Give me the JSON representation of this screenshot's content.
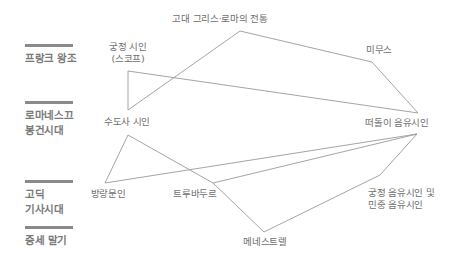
{
  "periods": [
    {
      "id": "frankish",
      "lines": [
        "프랑크 왕조"
      ],
      "top": 44
    },
    {
      "id": "romanesque",
      "lines": [
        "로마네스끄",
        "봉건시대"
      ],
      "top": 101
    },
    {
      "id": "gothic",
      "lines": [
        "고딕",
        "기사시대"
      ],
      "top": 180
    },
    {
      "id": "late-medieval",
      "lines": [
        "중세 말기"
      ],
      "top": 226
    }
  ],
  "nodes": {
    "greco_roman": {
      "lines": [
        "고대 그리스·로마의 전통"
      ],
      "x": 220,
      "y": 13
    },
    "court_poet": {
      "lines": [
        "궁정 시인",
        "(스코프)"
      ],
      "x": 128,
      "y": 41
    },
    "mime": {
      "lines": [
        "미무스"
      ],
      "x": 379,
      "y": 44
    },
    "monk_poet": {
      "lines": [
        "수도사 시인"
      ],
      "x": 127,
      "y": 116
    },
    "wandering_minstrel": {
      "lines": [
        "떠돌이 음유시인"
      ],
      "x": 397,
      "y": 117
    },
    "vagrant_scholar": {
      "lines": [
        "방랑문인"
      ],
      "x": 108,
      "y": 188
    },
    "troubadour": {
      "lines": [
        "트루바두르"
      ],
      "x": 195,
      "y": 188
    },
    "court_folk_minstrel": {
      "lines": [
        "궁정 음유시인 및",
        "민중 음유시인"
      ],
      "x": 368,
      "y": 187,
      "align": "left"
    },
    "menestrel": {
      "lines": [
        "메네스트렐"
      ],
      "x": 265,
      "y": 236
    }
  },
  "edges": [
    {
      "from": "court_poet",
      "to": "monk_poet",
      "points": [
        [
          128,
          71
        ],
        [
          128,
          110
        ]
      ]
    },
    {
      "from": "monk_poet",
      "to": "greco_roman",
      "points": [
        [
          128,
          110
        ],
        [
          240,
          31
        ]
      ]
    },
    {
      "from": "greco_roman",
      "to": "mime",
      "points": [
        [
          240,
          31
        ],
        [
          372,
          62
        ]
      ]
    },
    {
      "from": "mime",
      "to": "wandering_minstrel",
      "points": [
        [
          372,
          62
        ],
        [
          418,
          113
        ]
      ]
    },
    {
      "from": "court_poet",
      "to": "wandering_minstrel",
      "points": [
        [
          128,
          71
        ],
        [
          418,
          113
        ]
      ]
    },
    {
      "from": "monk_poet",
      "to": "vagrant_scholar",
      "points": [
        [
          128,
          135
        ],
        [
          105,
          183
        ]
      ]
    },
    {
      "from": "monk_poet",
      "to": "troubadour",
      "points": [
        [
          128,
          135
        ],
        [
          213,
          183
        ]
      ]
    },
    {
      "from": "troubadour",
      "to": "menestrel",
      "points": [
        [
          213,
          183
        ],
        [
          264,
          232
        ]
      ]
    },
    {
      "from": "menestrel",
      "to": "court_folk_minstrel",
      "points": [
        [
          264,
          232
        ],
        [
          380,
          175
        ]
      ]
    },
    {
      "from": "court_folk_minstrel",
      "to": "wandering_minstrel",
      "points": [
        [
          380,
          175
        ],
        [
          417,
          134
        ]
      ]
    },
    {
      "from": "vagrant_scholar",
      "to": "wandering_minstrel",
      "points": [
        [
          105,
          183
        ],
        [
          417,
          134
        ]
      ]
    },
    {
      "from": "troubadour",
      "to": "wandering_minstrel",
      "points": [
        [
          213,
          183
        ],
        [
          417,
          134
        ]
      ]
    }
  ],
  "colors": {
    "edge": "#9a9a9a",
    "period_bar": "#8a8a8a",
    "period_text": "#7a7a7a",
    "node_text": "#6e6e6e"
  }
}
